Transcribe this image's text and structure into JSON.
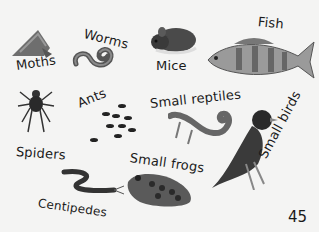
{
  "page": {
    "page_number": "45",
    "labels": {
      "moths": "Moths",
      "worms": "Worms",
      "mice": "Mice",
      "fish": "Fish",
      "spiders": "Spiders",
      "ants": "Ants",
      "small_reptiles": "Small reptiles",
      "small_frogs": "Small frogs",
      "small_birds": "Small birds",
      "centipedes": "Centipedes"
    },
    "illustrations": [
      "moth",
      "worm",
      "mouse",
      "fish",
      "spider",
      "ants",
      "lizard",
      "frog",
      "bird",
      "centipede"
    ],
    "palette": {
      "background": "#f4f4f3",
      "ink": "#1a1a1a",
      "dark": "#3a3a3a",
      "mid": "#7a7a7a",
      "light": "#b5b5b5"
    }
  }
}
